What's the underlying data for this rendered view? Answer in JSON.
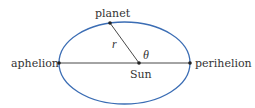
{
  "diagram": {
    "labels": {
      "planet": "planet",
      "radius": "r",
      "angle": "θ",
      "aphelion": "aphelion",
      "sun": "Sun",
      "perihelion": "perihelion"
    },
    "colors": {
      "orbit": "#3b6db4",
      "lines": "#333333",
      "text": "#333333"
    },
    "geometry": {
      "ellipse_center": [
        124.5,
        63
      ],
      "ellipse_rx": 65.5,
      "ellipse_ry": 41,
      "sun": [
        139,
        63
      ],
      "planet": [
        110,
        23
      ],
      "aphelion": [
        59,
        63
      ],
      "perihelion": [
        190,
        63
      ]
    }
  }
}
